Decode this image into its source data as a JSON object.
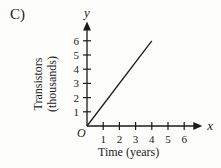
{
  "choice_label": "C)",
  "chart_data": {
    "type": "line",
    "title": "",
    "xlabel": "Time (years)",
    "ylabel_line1": "Transistors",
    "ylabel_line2": "(thousands)",
    "x_axis_var": "x",
    "y_axis_var": "y",
    "origin_label": "O",
    "x_ticks": [
      1,
      2,
      3,
      4,
      5,
      6
    ],
    "y_ticks": [
      1,
      2,
      3,
      4,
      5,
      6
    ],
    "xlim": [
      0,
      6.5
    ],
    "ylim": [
      0,
      6.8
    ],
    "grid": false,
    "series": [
      {
        "name": "transistors",
        "x": [
          0,
          4
        ],
        "y": [
          0,
          6
        ]
      }
    ],
    "line_color": "#1a1a1a"
  }
}
